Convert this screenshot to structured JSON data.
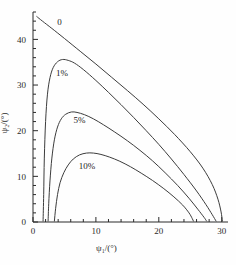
{
  "chart_data": {
    "type": "line",
    "title": "",
    "xlabel": "ψ₁/(°)",
    "ylabel": "ψ₂/(°)",
    "xlim": [
      0,
      31
    ],
    "ylim": [
      0,
      46
    ],
    "xticks": [
      0,
      10,
      20,
      30
    ],
    "yticks": [
      0,
      10,
      20,
      30,
      40
    ],
    "xtick_labels": [
      "0",
      "10",
      "20",
      "30"
    ],
    "ytick_labels": [
      "0",
      "10",
      "20",
      "30",
      "40"
    ],
    "x_minor_step": 2,
    "y_minor_step": 2,
    "grid": false,
    "legend": "inline-curve-labels",
    "line_color": "#3c3c3c",
    "axis_color": "#2a2a2a",
    "series": [
      {
        "name": "0",
        "label": "0",
        "label_x": 4.2,
        "label_y": 43.2,
        "points": [
          [
            0.6,
            45.0
          ],
          [
            1.5,
            44.0
          ],
          [
            3.0,
            42.4
          ],
          [
            5.0,
            40.2
          ],
          [
            7.5,
            37.4
          ],
          [
            10.0,
            34.6
          ],
          [
            12.5,
            31.7
          ],
          [
            15.0,
            28.8
          ],
          [
            17.5,
            25.8
          ],
          [
            20.0,
            22.6
          ],
          [
            22.5,
            19.2
          ],
          [
            25.0,
            15.4
          ],
          [
            27.0,
            11.8
          ],
          [
            28.5,
            8.2
          ],
          [
            29.4,
            5.0
          ],
          [
            29.9,
            2.2
          ],
          [
            30.1,
            0.2
          ]
        ]
      },
      {
        "name": "1%",
        "label": "1%",
        "label_x": 4.6,
        "label_y": 32.0,
        "points": [
          [
            1.6,
            0.2
          ],
          [
            1.7,
            6.0
          ],
          [
            1.8,
            14.0
          ],
          [
            2.0,
            22.0
          ],
          [
            2.3,
            28.0
          ],
          [
            2.7,
            31.6
          ],
          [
            3.2,
            33.8
          ],
          [
            3.9,
            35.1
          ],
          [
            4.7,
            35.6
          ],
          [
            5.6,
            35.4
          ],
          [
            6.6,
            34.8
          ],
          [
            8.0,
            33.4
          ],
          [
            10.0,
            31.0
          ],
          [
            12.0,
            28.4
          ],
          [
            14.0,
            25.7
          ],
          [
            16.0,
            22.9
          ],
          [
            18.0,
            20.0
          ],
          [
            20.0,
            17.0
          ],
          [
            22.0,
            13.8
          ],
          [
            24.0,
            10.4
          ],
          [
            26.0,
            6.8
          ],
          [
            27.5,
            3.8
          ],
          [
            28.5,
            1.6
          ],
          [
            29.1,
            0.2
          ]
        ]
      },
      {
        "name": "5%",
        "label": "5%",
        "label_x": 7.4,
        "label_y": 21.6,
        "points": [
          [
            2.4,
            0.2
          ],
          [
            2.5,
            4.0
          ],
          [
            2.7,
            9.0
          ],
          [
            3.0,
            14.0
          ],
          [
            3.4,
            18.0
          ],
          [
            3.9,
            20.8
          ],
          [
            4.5,
            22.6
          ],
          [
            5.2,
            23.6
          ],
          [
            6.1,
            24.1
          ],
          [
            7.0,
            24.0
          ],
          [
            8.2,
            23.5
          ],
          [
            9.6,
            22.6
          ],
          [
            11.2,
            21.3
          ],
          [
            13.0,
            19.7
          ],
          [
            15.0,
            17.8
          ],
          [
            17.0,
            15.7
          ],
          [
            19.0,
            13.4
          ],
          [
            21.0,
            10.8
          ],
          [
            23.0,
            8.0
          ],
          [
            24.8,
            5.2
          ],
          [
            26.2,
            2.8
          ],
          [
            27.2,
            1.0
          ],
          [
            27.6,
            0.2
          ]
        ]
      },
      {
        "name": "10%",
        "label": "10%",
        "label_x": 8.6,
        "label_y": 11.6,
        "points": [
          [
            3.4,
            0.2
          ],
          [
            3.6,
            3.0
          ],
          [
            3.9,
            6.0
          ],
          [
            4.3,
            8.6
          ],
          [
            4.9,
            10.8
          ],
          [
            5.6,
            12.5
          ],
          [
            6.4,
            13.8
          ],
          [
            7.4,
            14.7
          ],
          [
            8.5,
            15.1
          ],
          [
            9.6,
            15.1
          ],
          [
            10.8,
            14.8
          ],
          [
            12.2,
            14.2
          ],
          [
            13.8,
            13.3
          ],
          [
            15.5,
            12.1
          ],
          [
            17.2,
            10.7
          ],
          [
            19.0,
            9.1
          ],
          [
            20.8,
            7.3
          ],
          [
            22.4,
            5.5
          ],
          [
            23.8,
            3.7
          ],
          [
            24.8,
            2.0
          ],
          [
            25.3,
            0.8
          ],
          [
            25.5,
            0.2
          ]
        ]
      }
    ]
  },
  "axes": {
    "x_axis_name": "psi1-axis",
    "y_axis_name": "psi2-axis"
  }
}
